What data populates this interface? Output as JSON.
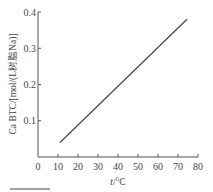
{
  "chart_data": {
    "type": "line",
    "title": "",
    "xlabel": "t/°C",
    "ylabel": "Ca BTC/[mol/(L树脂Na)]",
    "xlim": [
      0,
      80
    ],
    "ylim": [
      0,
      0.4
    ],
    "x_ticks": [
      "0",
      "10",
      "20",
      "30",
      "40",
      "50",
      "60",
      "70",
      "80"
    ],
    "y_ticks": [
      "0.1",
      "0.2",
      "0.3",
      "0.4"
    ],
    "grid": false,
    "legend": null,
    "series": [
      {
        "name": "Ca BTC",
        "x": [
          11,
          74.5
        ],
        "y": [
          0.04,
          0.38
        ]
      }
    ]
  },
  "labels": {
    "xlabel_italic": "t",
    "xlabel_unit": "/°C",
    "ylabel": "Ca BTC/[mol/(L树脂Na)]"
  }
}
